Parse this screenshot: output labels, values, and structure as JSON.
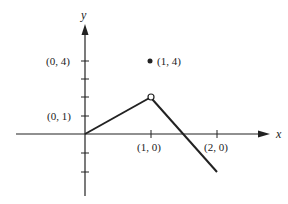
{
  "axes": {
    "x_label": "x",
    "y_label": "y"
  },
  "labels": {
    "y_tick_4": "(0, 4)",
    "y_tick_1": "(0, 1)",
    "x_tick_1": "(1, 0)",
    "x_tick_2": "(2, 0)",
    "point_isolated": "(1, 4)"
  },
  "graph": {
    "segments": [
      {
        "from": [
          0,
          0
        ],
        "to": [
          1,
          2
        ]
      },
      {
        "from": [
          1,
          2
        ],
        "to": [
          2,
          -2
        ]
      }
    ],
    "open_point": [
      1,
      2
    ],
    "filled_point": [
      1,
      4
    ]
  },
  "colors": {
    "ink": "#222222",
    "background": "#ffffff"
  }
}
